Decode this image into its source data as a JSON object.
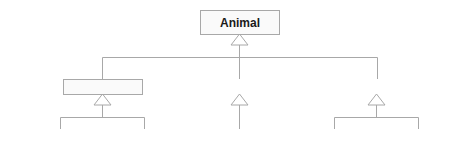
{
  "diagram": {
    "type": "class-hierarchy",
    "colors": {
      "border": "#a8a8a8",
      "text": "#1a1a1a",
      "line": "#a8a8a8",
      "leaf_fill": "#f2f2f2",
      "parent_fill": "#fafafa"
    },
    "root": {
      "label": "Animal"
    },
    "classes": [
      {
        "label": "Reptile",
        "children": [
          {
            "label": "Snake"
          },
          {
            "label": "Lizard"
          }
        ]
      },
      {
        "label": "Bird",
        "children": [
          {
            "label": "Parrot"
          }
        ]
      },
      {
        "label": "Mammal",
        "children": [
          {
            "label": "Horse"
          },
          {
            "label": "Bat"
          }
        ]
      }
    ]
  }
}
